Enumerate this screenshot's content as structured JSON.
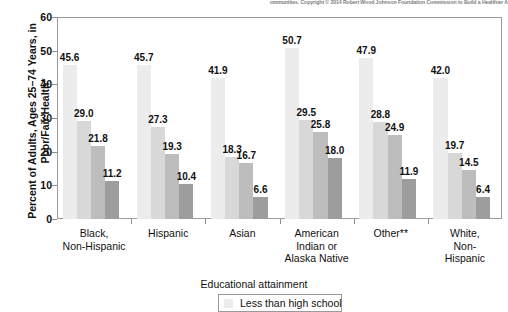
{
  "header": {
    "copyright_note": "ommunities. Copyright © 2014 Robert Wood Johnson Foundation Commission to Build a Healthier A"
  },
  "chart_data": {
    "type": "bar",
    "title": "",
    "xlabel": "",
    "ylabel": "Percent of Adults, Ages 25–74 Years, in Poor/Fair Health*",
    "ylim": [
      0,
      60
    ],
    "yticks": [
      0,
      10,
      20,
      30,
      40,
      50,
      60
    ],
    "grid": false,
    "legend_position": "bottom",
    "legend_title": "Educational attainment",
    "categories": [
      "Black,\nNon-Hispanic",
      "Hispanic",
      "Asian",
      "American\nIndian or\nAlaska Native",
      "Other**",
      "White,\nNon-Hispanic"
    ],
    "series": [
      {
        "name": "Less than high school",
        "color": "#ececed",
        "values": [
          45.6,
          45.7,
          41.9,
          50.7,
          47.9,
          42.0
        ]
      },
      {
        "name": "series-2",
        "color": "#d8d8d9",
        "values": [
          29.0,
          27.3,
          18.3,
          29.5,
          28.8,
          19.7
        ]
      },
      {
        "name": "series-3",
        "color": "#bdbdbe",
        "values": [
          21.8,
          19.3,
          16.7,
          25.8,
          24.9,
          14.5
        ]
      },
      {
        "name": "series-4",
        "color": "#9d9d9e",
        "values": [
          11.2,
          10.4,
          6.6,
          18.0,
          11.9,
          6.4
        ]
      }
    ]
  },
  "legend": {
    "title": "Educational attainment",
    "entries": [
      {
        "label": "Less than high school",
        "color": "#ececed"
      }
    ]
  }
}
